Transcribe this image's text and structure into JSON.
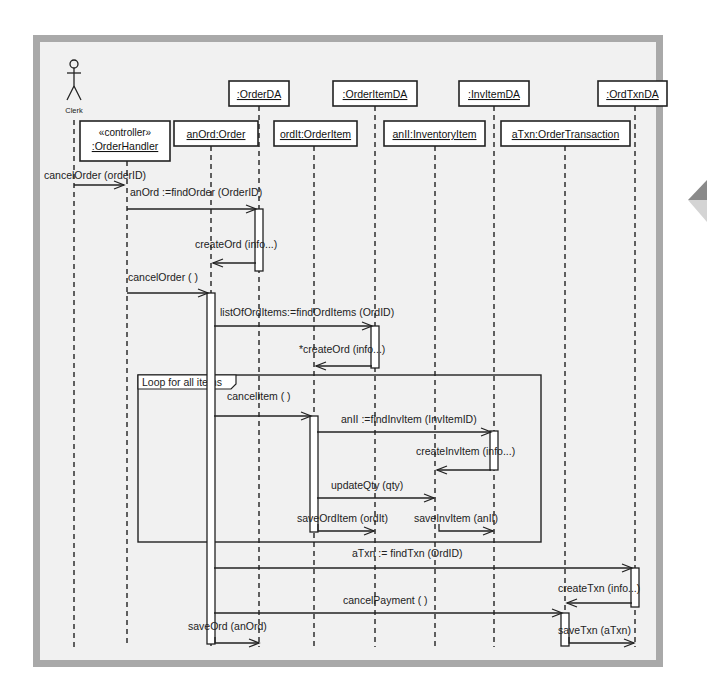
{
  "actor": {
    "id": "clerk",
    "label": "Clerk",
    "x": 74
  },
  "objects": [
    {
      "id": "handler",
      "stereotype": "«controller»",
      "label": ":OrderHandler",
      "x": 127,
      "box": [
        80,
        121,
        90,
        40
      ],
      "text_y": 150
    },
    {
      "id": "order",
      "label": "anOrd:Order",
      "x": 211,
      "box": [
        174,
        121,
        84,
        25
      ],
      "text_y": 138
    },
    {
      "id": "orderda",
      "label": ":OrderDA",
      "x": 259,
      "box": [
        229,
        81,
        60,
        25
      ],
      "text_y": 98
    },
    {
      "id": "orderitem",
      "label": "ordIt:OrderItem",
      "x": 314,
      "box": [
        274,
        121,
        83,
        25
      ],
      "text_y": 138
    },
    {
      "id": "orderitemda",
      "label": ":OrderItemDA",
      "x": 375,
      "box": [
        333,
        81,
        84,
        25
      ],
      "text_y": 98
    },
    {
      "id": "invitem",
      "label": "anII:InventoryItem",
      "x": 435,
      "box": [
        384,
        121,
        101,
        25
      ],
      "text_y": 138
    },
    {
      "id": "invitemda",
      "label": ":InvItemDA",
      "x": 494,
      "box": [
        459,
        81,
        70,
        25
      ],
      "text_y": 98
    },
    {
      "id": "txn",
      "label": "aTxn:OrderTransaction",
      "x": 565,
      "box": [
        501,
        121,
        129,
        25
      ],
      "text_y": 138
    },
    {
      "id": "ordtxnda",
      "label": ":OrdTxnDA",
      "x": 635,
      "box": [
        598,
        81,
        69,
        25
      ],
      "text_y": 98
    }
  ],
  "lifeline_end_y": 647,
  "activations": [
    {
      "lifeline": "orderda",
      "x": 259,
      "y1": 209,
      "y2": 271
    },
    {
      "lifeline": "order",
      "x": 211,
      "y1": 293,
      "y2": 644
    },
    {
      "lifeline": "orderitemda",
      "x": 375,
      "y1": 326,
      "y2": 368
    },
    {
      "lifeline": "orderitem",
      "x": 314,
      "y1": 416,
      "y2": 532
    },
    {
      "lifeline": "invitemda",
      "x": 494,
      "y1": 431,
      "y2": 470
    },
    {
      "lifeline": "ordtxnda",
      "x": 635,
      "y1": 568,
      "y2": 607
    },
    {
      "lifeline": "txn",
      "x": 565,
      "y1": 613,
      "y2": 646
    }
  ],
  "messages": [
    {
      "id": "m1",
      "label": "cancelOrder (orderID)",
      "from_x": 74,
      "to_x": 124,
      "y": 185,
      "label_x": 44,
      "label_y": 179,
      "dir": "right"
    },
    {
      "id": "m2",
      "label": "anOrd :=findOrder (OrderID)",
      "from_x": 127,
      "to_x": 256,
      "y": 209,
      "label_x": 130,
      "label_y": 196,
      "dir": "right"
    },
    {
      "id": "m3",
      "label": "createOrd (info...)",
      "from_x": 256,
      "to_x": 213,
      "y": 263,
      "label_x": 195,
      "label_y": 248,
      "dir": "left"
    },
    {
      "id": "m4",
      "label": "cancelOrder ( )",
      "from_x": 127,
      "to_x": 208,
      "y": 293,
      "label_x": 128,
      "label_y": 281,
      "dir": "right"
    },
    {
      "id": "m5",
      "label": "listOfOrdItems:=findOrdItems (OrdID)",
      "from_x": 214,
      "to_x": 372,
      "y": 326,
      "label_x": 220,
      "label_y": 316,
      "dir": "right"
    },
    {
      "id": "m6",
      "label": "*createOrd (info...)",
      "from_x": 372,
      "to_x": 316,
      "y": 366,
      "label_x": 299,
      "label_y": 353,
      "dir": "left"
    },
    {
      "id": "m7",
      "label": "cancelItem ( )",
      "from_x": 214,
      "to_x": 311,
      "y": 416,
      "label_x": 227,
      "label_y": 400,
      "dir": "right"
    },
    {
      "id": "m8",
      "label": "anII :=findInvItem (InvItemID)",
      "from_x": 317,
      "to_x": 491,
      "y": 432,
      "label_x": 341,
      "label_y": 423,
      "dir": "right"
    },
    {
      "id": "m9",
      "label": "createInvItem (info...)",
      "from_x": 491,
      "to_x": 437,
      "y": 470,
      "label_x": 416,
      "label_y": 455,
      "dir": "left"
    },
    {
      "id": "m10",
      "label": "updateQty (qty)",
      "from_x": 317,
      "to_x": 434,
      "y": 498,
      "label_x": 331,
      "label_y": 489,
      "dir": "right"
    },
    {
      "id": "m11",
      "label": "saveOrdItem (ordIt)",
      "from_x": 314,
      "to_x": 374,
      "y": 531,
      "label_x": 297,
      "label_y": 522,
      "self_from_y": 524,
      "dir": "right"
    },
    {
      "id": "m12",
      "label": "saveInvItem (anII)",
      "from_x": 435,
      "to_x": 493,
      "y": 531,
      "label_x": 414,
      "label_y": 522,
      "self_from_y": 524,
      "dir": "right"
    },
    {
      "id": "m13",
      "label": "aTxn := findTxn (OrdID)",
      "from_x": 214,
      "to_x": 632,
      "y": 568,
      "label_x": 352,
      "label_y": 557,
      "dir": "right"
    },
    {
      "id": "m14",
      "label": "createTxn (info...)",
      "from_x": 632,
      "to_x": 567,
      "y": 603,
      "label_x": 558,
      "label_y": 592,
      "dir": "left"
    },
    {
      "id": "m15",
      "label": "cancelPayment ( )",
      "from_x": 214,
      "to_x": 562,
      "y": 613,
      "label_x": 343,
      "label_y": 604,
      "dir": "right"
    },
    {
      "id": "m16",
      "label": "saveOrd (anOrd)",
      "from_x": 211,
      "to_x": 259,
      "y": 643,
      "label_x": 188,
      "label_y": 630,
      "self_from_y": 637,
      "dir": "right"
    },
    {
      "id": "m17",
      "label": "saveTxn (aTxn)",
      "from_x": 565,
      "to_x": 634,
      "y": 643,
      "label_x": 558,
      "label_y": 634,
      "self_from_y": 637,
      "dir": "right"
    }
  ],
  "loop_fragment": {
    "label": "Loop for all items",
    "x": 138,
    "y": 375,
    "width": 403,
    "height": 167
  },
  "colors": {
    "frame_border": "#a9a9a9",
    "frame_bg": "#f1f1f1",
    "line": "#222222",
    "box_fill": "#ffffff"
  }
}
